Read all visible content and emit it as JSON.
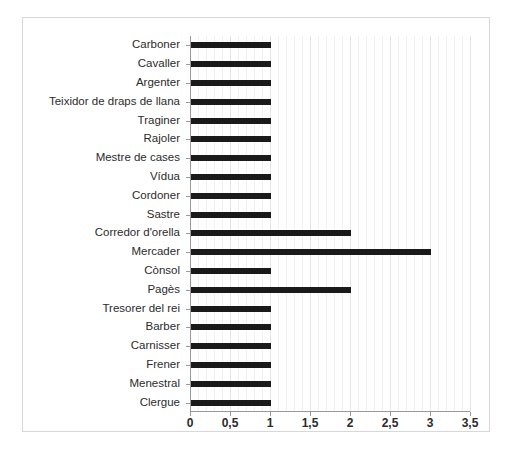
{
  "chart_data": {
    "type": "bar",
    "orientation": "horizontal",
    "title": "",
    "subtitle": "",
    "xlabel": "",
    "ylabel": "",
    "categories": [
      "Carboner",
      "Cavaller",
      "Argenter",
      "Teixidor de draps de llana",
      "Traginer",
      "Rajoler",
      "Mestre de cases",
      "Vídua",
      "Cordoner",
      "Sastre",
      "Corredor d'orella",
      "Mercader",
      "Cònsol",
      "Pagès",
      "Tresorer del rei",
      "Barber",
      "Carnisser",
      "Frener",
      "Menestral",
      "Clergue"
    ],
    "values": [
      1,
      1,
      1,
      1,
      1,
      1,
      1,
      1,
      1,
      1,
      2,
      3,
      1,
      2,
      1,
      1,
      1,
      1,
      1,
      1
    ],
    "xlim": [
      0,
      3.5
    ],
    "xticks": [
      0,
      0.5,
      1,
      1.5,
      2,
      2.5,
      3,
      3.5
    ],
    "xticklabels": [
      "0",
      "0,5",
      "1",
      "1,5",
      "2",
      "2,5",
      "3",
      "3,5"
    ],
    "grid": "minor-vertical",
    "legend": "none",
    "bar_color": "#1a1a1a",
    "background_color": "#ffffff",
    "border_color": "#d8d8d8",
    "axis_color": "#9a9a9a",
    "gridline_color": "#f0f0f0"
  }
}
